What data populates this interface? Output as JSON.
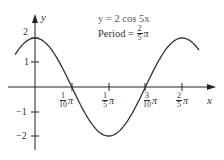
{
  "chart_data": {
    "type": "line",
    "title": "y = 2 cos 5x",
    "annotations": [
      {
        "text": "y = 2 cos 5x"
      },
      {
        "text": "Period = 2/5 π",
        "prefix": "Period =",
        "num": "2",
        "den": "5",
        "suffix": "π"
      }
    ],
    "xlabel": "x",
    "ylabel": "y",
    "x_ticks": [
      {
        "num": "1",
        "den": "10",
        "suffix": "π",
        "value": 0.314159
      },
      {
        "num": "1",
        "den": "5",
        "suffix": "π",
        "value": 0.628319
      },
      {
        "num": "3",
        "den": "10",
        "suffix": "π",
        "value": 0.942478
      },
      {
        "num": "2",
        "den": "5",
        "suffix": "π",
        "value": 1.256637
      }
    ],
    "y_ticks": [
      {
        "label": "2",
        "value": 2
      },
      {
        "label": "1",
        "value": 1
      },
      {
        "label": "−1",
        "value": -1
      },
      {
        "label": "−2",
        "value": -2
      }
    ],
    "series": [
      {
        "name": "y = 2 cos 5x",
        "function": "2*cos(5*x)",
        "x": [
          -0.17,
          0.0,
          0.157,
          0.314,
          0.471,
          0.628,
          0.785,
          0.942,
          1.1,
          1.257,
          1.4
        ],
        "values": [
          1.32,
          2.0,
          1.41,
          0.0,
          -1.41,
          -2.0,
          -1.41,
          0.0,
          1.41,
          2.0,
          1.52
        ]
      }
    ],
    "xlim": [
      -0.17,
      1.4
    ],
    "ylim": [
      -2.5,
      2.5
    ],
    "grid": false,
    "legend": "none"
  }
}
